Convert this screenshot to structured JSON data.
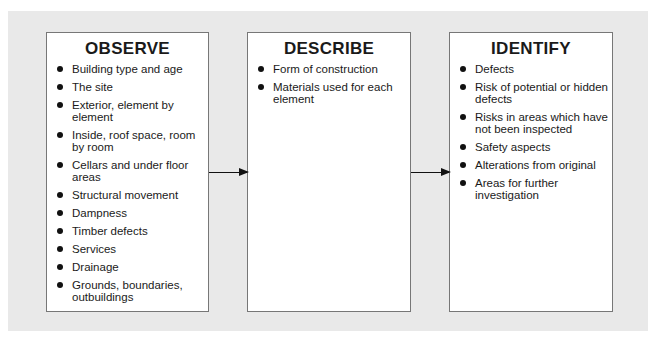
{
  "boxes": [
    {
      "title": "OBSERVE",
      "items": [
        "Building type and age",
        "The site",
        "Exterior, element by element",
        "Inside, roof space, room by room",
        "Cellars and under floor areas",
        "Structural movement",
        "Dampness",
        "Timber defects",
        "Services",
        "Drainage",
        "Grounds, boundaries, outbuildings"
      ]
    },
    {
      "title": "DESCRIBE",
      "items": [
        "Form of construction",
        "Materials used for each element"
      ]
    },
    {
      "title": "IDENTIFY",
      "items": [
        "Defects",
        "Risk of potential or hidden defects",
        "Risks in areas which have not been inspected",
        "Safety aspects",
        "Alterations from original",
        "Areas for further investigation"
      ]
    }
  ],
  "arrows": [
    {
      "from": "OBSERVE",
      "to": "DESCRIBE"
    },
    {
      "from": "DESCRIBE",
      "to": "IDENTIFY"
    }
  ],
  "colors": {
    "panel": "#e9e9e9",
    "box": "#ffffff",
    "border": "#777777",
    "text": "#1a1a1a"
  }
}
